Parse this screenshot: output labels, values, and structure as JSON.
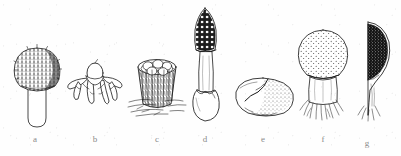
{
  "plate": {
    "title": "Gasteromycetes plate",
    "background_color": "#ffffff",
    "ink_color": "#1a1a1a",
    "label_color": "#8a8a8a",
    "width": 401,
    "height": 156,
    "style": "pen-and-ink line drawing, scanned"
  },
  "figures": [
    {
      "key": "a",
      "label": "a",
      "name": "spiny-capped-puffball",
      "description": "Rounded cap densely covered with short spines and warts, seated on a short thick smooth cylindrical stalk with rounded base",
      "label_x": 35,
      "label_y": 139
    },
    {
      "key": "b",
      "label": "b",
      "name": "earthstar",
      "description": "Earthstar with recurved pointed rays spread outward and a small ovoid spore sac at the centre",
      "label_x": 95,
      "label_y": 139
    },
    {
      "key": "c",
      "label": "c",
      "name": "birds-nest-fungus",
      "description": "Bird's nest fungus: flaring shaggy cup containing several egg-like peridioles, resting on hairy radiating mycelial strands",
      "label_x": 157,
      "label_y": 139
    },
    {
      "key": "d",
      "label": "d",
      "name": "stinkhorn",
      "description": "Stinkhorn: conical dark reticulate cap on a long pale hollow stalk rising from a sac-like volva at the base",
      "label_x": 205,
      "label_y": 139
    },
    {
      "key": "e",
      "label": "e",
      "name": "false-truffle",
      "description": "Irregular rounded tuber-like body, one side smooth the other stippled, with a cleft or crack across the surface",
      "label_x": 263,
      "label_y": 139
    },
    {
      "key": "f",
      "label": "f",
      "name": "pear-shaped-puffball",
      "description": "Pear-shaped puffball with finely dotted head narrowing to a stout sterile base bearing white rooting mycelial threads",
      "label_x": 323,
      "label_y": 139
    },
    {
      "key": "g",
      "label": "g",
      "name": "puffball-section",
      "description": "Longitudinal section of the puffball showing the dark granular spore mass (gleba) filling the head above the sterile base",
      "label_x": 367,
      "label_y": 143
    }
  ]
}
